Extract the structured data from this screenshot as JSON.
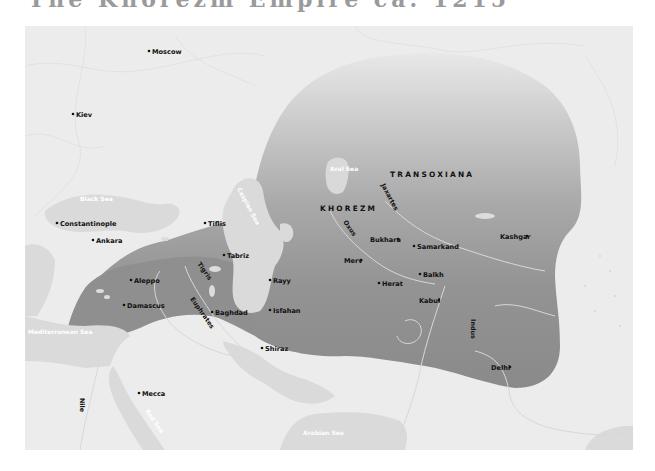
{
  "title": "The Khorezm Empire ca. 1215",
  "colors": {
    "land": "#ececec",
    "water": "#dadada",
    "empire_dark": "#8e8e8e",
    "empire_fade": "#e6e6e6",
    "river": "#d9d9d9",
    "text": "#111111",
    "water_text": "#ffffff"
  },
  "regions": [
    {
      "name": "TRANSOXIANA"
    },
    {
      "name": "KHOREZM"
    }
  ],
  "seas": [
    {
      "name": "Black Sea"
    },
    {
      "name": "Caspian Sea"
    },
    {
      "name": "Aral Sea"
    },
    {
      "name": "Mediterranean Sea"
    },
    {
      "name": "Red Sea"
    },
    {
      "name": "Arabian Sea"
    }
  ],
  "rivers": [
    {
      "name": "Tigris"
    },
    {
      "name": "Euphrates"
    },
    {
      "name": "Oxus"
    },
    {
      "name": "Jaxartes"
    },
    {
      "name": "Indus"
    },
    {
      "name": "Nile"
    }
  ],
  "cities": [
    {
      "name": "Moscow",
      "dot": "left"
    },
    {
      "name": "Kiev",
      "dot": "left"
    },
    {
      "name": "Constantinople",
      "dot": "left"
    },
    {
      "name": "Ankara",
      "dot": "left"
    },
    {
      "name": "Tiflis",
      "dot": "left"
    },
    {
      "name": "Tabriz",
      "dot": "left"
    },
    {
      "name": "Aleppo",
      "dot": "left"
    },
    {
      "name": "Damascus",
      "dot": "left"
    },
    {
      "name": "Baghdad",
      "dot": "left"
    },
    {
      "name": "Rayy",
      "dot": "left"
    },
    {
      "name": "Isfahan",
      "dot": "left"
    },
    {
      "name": "Shiraz",
      "dot": "left"
    },
    {
      "name": "Mecca",
      "dot": "left"
    },
    {
      "name": "Bukhara",
      "dot": "right"
    },
    {
      "name": "Samarkand",
      "dot": "left"
    },
    {
      "name": "Merv",
      "dot": "right"
    },
    {
      "name": "Herat",
      "dot": "left"
    },
    {
      "name": "Balkh",
      "dot": "left"
    },
    {
      "name": "Kabul",
      "dot": "right"
    },
    {
      "name": "Kashgar",
      "dot": "right"
    },
    {
      "name": "Delhi",
      "dot": "right"
    }
  ]
}
